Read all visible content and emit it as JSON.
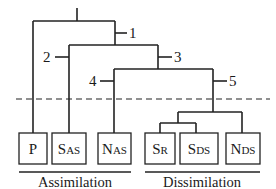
{
  "diagram": {
    "type": "tree",
    "nodes": [
      {
        "id": "1",
        "label": "1"
      },
      {
        "id": "2",
        "label": "2"
      },
      {
        "id": "3",
        "label": "3"
      },
      {
        "id": "4",
        "label": "4"
      },
      {
        "id": "5",
        "label": "5"
      }
    ],
    "leaves": [
      {
        "id": "P",
        "main": "P",
        "sub": ""
      },
      {
        "id": "SAS",
        "main": "S",
        "sub": "AS"
      },
      {
        "id": "NAS",
        "main": "N",
        "sub": "AS"
      },
      {
        "id": "SR",
        "main": "S",
        "sub": "R"
      },
      {
        "id": "SDS",
        "main": "S",
        "sub": "DS"
      },
      {
        "id": "NDS",
        "main": "N",
        "sub": "DS"
      }
    ],
    "groups": [
      {
        "id": "assimilation",
        "label": "Assimilation"
      },
      {
        "id": "dissimilation",
        "label": "Dissimilation"
      }
    ],
    "colors": {
      "line": "#222222",
      "background": "#ffffff"
    }
  }
}
